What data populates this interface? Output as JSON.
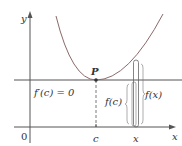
{
  "diagram": {
    "type": "calculus-figure",
    "axes": {
      "x_label": "x",
      "y_label": "y",
      "origin_label": "0"
    },
    "tick_labels": {
      "c": "c",
      "x": "x"
    },
    "point": {
      "label": "P"
    },
    "annotations": {
      "derivative": "f′(c) = 0",
      "fc": "f(c)",
      "fx": "f(x)"
    },
    "colors": {
      "axis": "#555555",
      "curve": "#8a6a6a",
      "tangent": "#555555",
      "text": "#333333",
      "background": "#ffffff"
    }
  }
}
